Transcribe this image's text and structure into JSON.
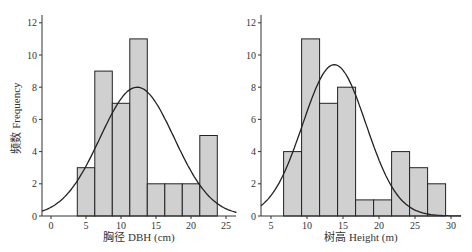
{
  "chart_data": [
    {
      "type": "bar",
      "subtype": "histogram_with_normal_curve",
      "title": "",
      "xlabel": "胸径 DBH (cm)",
      "ylabel": "频数 Frequency",
      "xlim": [
        -1.3,
        26.5
      ],
      "ylim": [
        0,
        12.5
      ],
      "xticks": [
        0,
        5,
        10,
        15,
        20,
        25
      ],
      "yticks": [
        0,
        2,
        4,
        6,
        8,
        10,
        12
      ],
      "bin_width": 2.5,
      "bins": [
        [
          3.75,
          6.25
        ],
        [
          6.25,
          8.75
        ],
        [
          8.75,
          11.25
        ],
        [
          11.25,
          13.75
        ],
        [
          13.75,
          16.25
        ],
        [
          16.25,
          18.75
        ],
        [
          18.75,
          21.25
        ],
        [
          21.25,
          23.75
        ]
      ],
      "categories": [
        "3.75-6.25",
        "6.25-8.75",
        "8.75-11.25",
        "11.25-13.75",
        "13.75-16.25",
        "16.25-18.75",
        "18.75-21.25",
        "21.25-23.75"
      ],
      "values": [
        3,
        9,
        7,
        11,
        2,
        2,
        2,
        5
      ],
      "normal_curve": {
        "mean": 12.3,
        "sd": 5.3,
        "peak": 8.0
      },
      "grid": false
    },
    {
      "type": "bar",
      "subtype": "histogram_with_normal_curve",
      "title": "",
      "xlabel": "树高 Height (m)",
      "ylabel": "",
      "xlim": [
        3.6,
        31.4
      ],
      "ylim": [
        0,
        12.5
      ],
      "xticks": [
        5,
        10,
        15,
        20,
        25,
        30
      ],
      "yticks": [
        0,
        2,
        4,
        6,
        8,
        10,
        12
      ],
      "bin_width": 2.5,
      "bins": [
        [
          6.75,
          9.25
        ],
        [
          9.25,
          11.75
        ],
        [
          11.75,
          14.25
        ],
        [
          14.25,
          16.75
        ],
        [
          16.75,
          19.25
        ],
        [
          19.25,
          21.75
        ],
        [
          21.75,
          24.25
        ],
        [
          24.25,
          26.75
        ],
        [
          26.75,
          29.25
        ]
      ],
      "categories": [
        "6.75-9.25",
        "9.25-11.75",
        "11.75-14.25",
        "14.25-16.75",
        "16.75-19.25",
        "19.25-21.75",
        "21.75-24.25",
        "24.25-26.75",
        "26.75-29.25"
      ],
      "values": [
        4,
        11,
        7,
        8,
        1,
        1,
        4,
        3,
        2
      ],
      "normal_curve": {
        "mean": 13.8,
        "sd": 4.4,
        "peak": 9.4
      },
      "grid": false
    }
  ],
  "layout": [
    {
      "x0px": 51,
      "pxPerX": 7.0,
      "axisLeft": 42,
      "axisRight": 236,
      "y0px": 216,
      "pxPerY": 16.1,
      "axisTop": 15
    },
    {
      "x0px": 235,
      "pxPerX": 7.2,
      "axisLeft": 261,
      "axisRight": 461,
      "y0px": 216,
      "pxPerY": 16.1,
      "axisTop": 15
    }
  ]
}
